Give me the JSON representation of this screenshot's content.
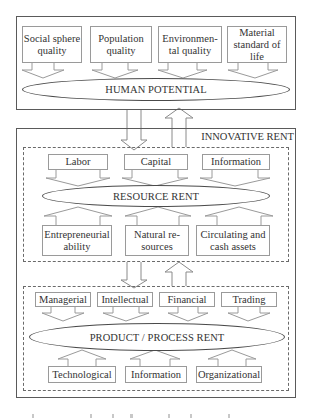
{
  "diagram": {
    "human_potential": {
      "title": "HUMAN POTENTIAL",
      "inputs": [
        {
          "label": "Social sphere quality"
        },
        {
          "label": "Population quality"
        },
        {
          "label": "Environmen-tal quality"
        },
        {
          "label": "Material standard of life"
        }
      ]
    },
    "innovative_rent": {
      "title": "INNOVATIVE RENT",
      "resource_rent": {
        "title": "RESOURCE RENT",
        "top_inputs": [
          {
            "label": "Labor"
          },
          {
            "label": "Capital"
          },
          {
            "label": "Information"
          }
        ],
        "bottom_inputs": [
          {
            "label": "Entrepreneurial ability"
          },
          {
            "label": "Natural re-sources"
          },
          {
            "label": "Circulating and cash assets"
          }
        ]
      },
      "product_process_rent": {
        "title": "PRODUCT / PROCESS RENT",
        "top_inputs": [
          {
            "label": "Managerial"
          },
          {
            "label": "Intellectual"
          },
          {
            "label": "Financial"
          },
          {
            "label": "Trading"
          }
        ],
        "bottom_inputs": [
          {
            "label": "Technological"
          },
          {
            "label": "Information"
          },
          {
            "label": "Organizational"
          }
        ]
      }
    },
    "connections": [
      {
        "from": "HUMAN POTENTIAL",
        "to": "INNOVATIVE RENT",
        "direction": "down"
      },
      {
        "from": "INNOVATIVE RENT",
        "to": "HUMAN POTENTIAL",
        "direction": "up"
      },
      {
        "from": "RESOURCE RENT",
        "to": "PRODUCT / PROCESS RENT",
        "direction": "down"
      },
      {
        "from": "PRODUCT / PROCESS RENT",
        "to": "RESOURCE RENT",
        "direction": "up"
      }
    ]
  }
}
